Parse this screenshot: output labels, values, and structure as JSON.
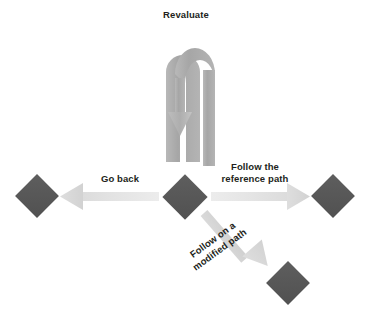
{
  "diagram": {
    "title_label": "Revaluate",
    "background_color": "#ffffff",
    "node_color": "#575757",
    "arrow_light_color": "#e9e9e9",
    "arrow_head_color": "#d9d9d9",
    "arrow_medium_color": "#a8a8a8",
    "text_color": "#231f20",
    "nodes": [
      {
        "name": "left-node",
        "x": 37,
        "y": 196,
        "size": 31
      },
      {
        "name": "center-node",
        "x": 185,
        "y": 197,
        "size": 32
      },
      {
        "name": "right-node",
        "x": 333,
        "y": 196,
        "size": 31
      },
      {
        "name": "bottom-right-node",
        "x": 288,
        "y": 283,
        "size": 31
      }
    ],
    "arrows": [
      {
        "name": "revaluate-uturn-arrow",
        "label": "Revaluate",
        "direction": "u-turn-down",
        "from": "center-node",
        "to": "center-node"
      },
      {
        "name": "go-back-arrow",
        "label": "Go back",
        "direction": "left",
        "from": "center-node",
        "to": "left-node"
      },
      {
        "name": "reference-path-arrow",
        "label_line1": "Follow the",
        "label_line2": "reference path",
        "direction": "right",
        "from": "center-node",
        "to": "right-node"
      },
      {
        "name": "modified-path-arrow",
        "label_line1": "Follow on a",
        "label_line2": "modified path",
        "direction": "down-right",
        "rotation_deg": -36,
        "from": "center-node",
        "to": "bottom-right-node"
      }
    ]
  }
}
